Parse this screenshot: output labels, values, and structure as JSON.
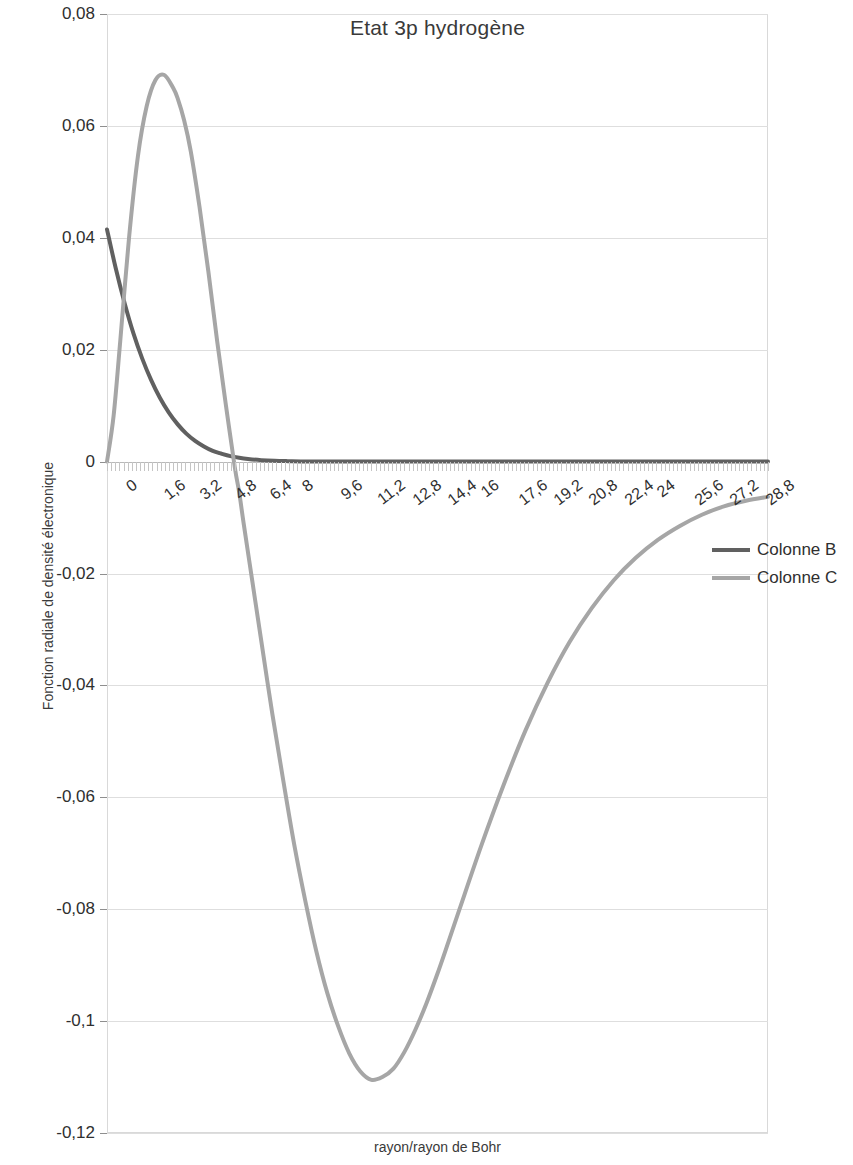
{
  "chart_data": {
    "type": "line",
    "title": "Etat 3p hydrogène",
    "xlabel": "rayon/rayon de Bohr",
    "ylabel": "Fonction radiale de densité électronique",
    "xlim": [
      0,
      30
    ],
    "ylim": [
      -0.12,
      0.08
    ],
    "grid": true,
    "legend_position": "right",
    "x_ticks": [
      "0",
      "1,6",
      "3,2",
      "4,8",
      "6,4",
      "8",
      "9,6",
      "11,2",
      "12,8",
      "14,4",
      "16",
      "17,6",
      "19,2",
      "20,8",
      "22,4",
      "24",
      "25,6",
      "27,2",
      "28,8"
    ],
    "x_tick_values": [
      0,
      1.6,
      3.2,
      4.8,
      6.4,
      8,
      9.6,
      11.2,
      12.8,
      14.4,
      16,
      17.6,
      19.2,
      20.8,
      22.4,
      24,
      25.6,
      27.2,
      28.8
    ],
    "y_ticks": [
      "0,08",
      "0,06",
      "0,04",
      "0,02",
      "0",
      "-0,02",
      "-0,04",
      "-0,06",
      "-0,08",
      "-0,1",
      "-0,12"
    ],
    "y_tick_values": [
      0.08,
      0.06,
      0.04,
      0.02,
      0,
      -0.02,
      -0.04,
      -0.06,
      -0.08,
      -0.1,
      -0.12
    ],
    "series": [
      {
        "name": "Colonne B",
        "color": "#606060",
        "width": 4,
        "x": [
          0,
          0.4,
          0.8,
          1.2,
          1.6,
          2.0,
          2.4,
          2.8,
          3.2,
          3.6,
          4.0,
          4.4,
          4.8,
          5.2,
          5.6,
          6.0,
          6.4,
          7.0,
          7.6,
          8.2,
          8.8,
          9.6,
          10.4,
          11.2,
          12.0,
          13.0,
          14.0,
          15.0,
          16.0,
          18.0,
          20.0,
          22.0,
          24.0,
          26.0,
          28.0,
          30.0
        ],
        "values": [
          0.0415,
          0.0345,
          0.0283,
          0.0229,
          0.0184,
          0.0146,
          0.0114,
          0.0088,
          0.0067,
          0.005,
          0.0037,
          0.0027,
          0.0019,
          0.0014,
          0.00097,
          0.00068,
          0.00047,
          0.00026,
          0.00014,
          8e-05,
          4e-05,
          2e-05,
          1e-05,
          5e-06,
          2e-06,
          1e-06,
          0,
          0,
          0,
          0,
          0,
          0,
          0,
          0,
          0,
          0
        ]
      },
      {
        "name": "Colonne C",
        "color": "#a6a6a6",
        "width": 4,
        "x": [
          0,
          0.3,
          0.6,
          1.0,
          1.4,
          1.8,
          2.2,
          2.6,
          3.0,
          3.2,
          3.5,
          3.8,
          4.2,
          4.6,
          5.0,
          5.4,
          5.8,
          6.0,
          6.2,
          6.6,
          7.0,
          7.5,
          8.0,
          8.5,
          9.0,
          9.5,
          10.0,
          10.5,
          11.0,
          11.5,
          12.0,
          12.5,
          13.0,
          13.5,
          14.0,
          14.5,
          15.0,
          15.5,
          16.0,
          17.0,
          18.0,
          19.0,
          20.0,
          21.0,
          22.0,
          23.0,
          24.0,
          25.0,
          26.0,
          27.0,
          28.0,
          29.0,
          30.0
        ],
        "values": [
          0.0,
          0.0082,
          0.0215,
          0.04,
          0.0545,
          0.0635,
          0.0682,
          0.0691,
          0.0668,
          0.065,
          0.061,
          0.0555,
          0.0455,
          0.034,
          0.0215,
          0.01,
          -0.001,
          -0.0055,
          -0.011,
          -0.0215,
          -0.032,
          -0.045,
          -0.057,
          -0.0685,
          -0.0785,
          -0.0875,
          -0.095,
          -0.101,
          -0.1058,
          -0.109,
          -0.1105,
          -0.11,
          -0.1085,
          -0.1055,
          -0.1015,
          -0.0968,
          -0.0915,
          -0.0858,
          -0.08,
          -0.0685,
          -0.0578,
          -0.048,
          -0.0395,
          -0.0322,
          -0.0262,
          -0.0212,
          -0.0172,
          -0.014,
          -0.0115,
          -0.0095,
          -0.008,
          -0.007,
          -0.0063
        ]
      }
    ]
  },
  "legend": {
    "items": [
      {
        "label": "Colonne B",
        "color": "#606060"
      },
      {
        "label": "Colonne C",
        "color": "#a6a6a6"
      }
    ]
  }
}
